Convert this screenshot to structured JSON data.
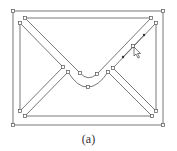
{
  "figure": {
    "caption": "(a)",
    "stroke_color": "#555555",
    "anchor_fill": "#ffffff",
    "outer_rect": {
      "x1": 13,
      "y1": 11,
      "x2": 163,
      "y2": 125
    },
    "inner_left_side": [
      [
        20,
        23
      ],
      [
        20,
        111
      ]
    ],
    "inner_right_side": [
      [
        156,
        23
      ],
      [
        156,
        111
      ]
    ],
    "inner_top": [
      [
        25,
        18
      ],
      [
        151,
        18
      ]
    ],
    "inner_bottom": [
      [
        25,
        116
      ],
      [
        152,
        116
      ]
    ],
    "selected_anchor": [
      133,
      46
    ],
    "handles": [
      [
        144,
        35
      ],
      [
        123,
        57
      ]
    ],
    "cursor": "arrow-cursor"
  }
}
